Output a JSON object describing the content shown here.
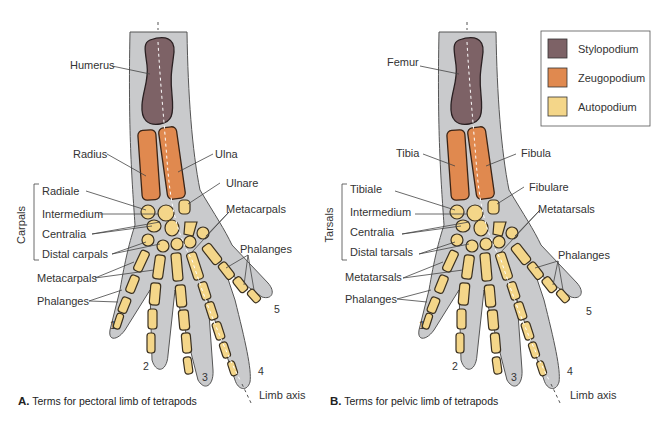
{
  "legend": {
    "items": [
      {
        "label": "Stylopodium",
        "color": "#7d6266"
      },
      {
        "label": "Zeugopodium",
        "color": "#e0894f"
      },
      {
        "label": "Autopodium",
        "color": "#f4d689"
      }
    ]
  },
  "panel_a": {
    "caption_letter": "A.",
    "caption_text": "Terms for pectoral limb of tetrapods",
    "group_label": "Carpals",
    "labels": {
      "humerus": "Humerus",
      "radius": "Radius",
      "ulna": "Ulna",
      "radiale": "Radiale",
      "ulnare": "Ulnare",
      "intermedium": "Intermedium",
      "centralia": "Centralia",
      "distal": "Distal carpals",
      "metacarpals_left": "Metacarpals",
      "metacarpals_right": "Metacarpals",
      "phalanges_left": "Phalanges",
      "phalanges_right": "Phalanges",
      "limb_axis": "Limb axis"
    },
    "digits": [
      "1",
      "2",
      "3",
      "4",
      "5"
    ]
  },
  "panel_b": {
    "caption_letter": "B.",
    "caption_text": "Terms for pelvic limb of tetrapods",
    "group_label": "Tarsals",
    "labels": {
      "femur": "Femur",
      "tibia": "Tibia",
      "fibula": "Fibula",
      "tibiale": "Tibiale",
      "fibulare": "Fibulare",
      "intermedium": "Intermedium",
      "centralia": "Centralia",
      "distal": "Distal tarsals",
      "metatarsals_left": "Metatarsals",
      "metatarsals_right": "Metatarsals",
      "phalanges_left": "Phalanges",
      "phalanges_right": "Phalanges",
      "limb_axis": "Limb axis"
    },
    "digits": [
      "1",
      "2",
      "3",
      "4",
      "5"
    ]
  }
}
